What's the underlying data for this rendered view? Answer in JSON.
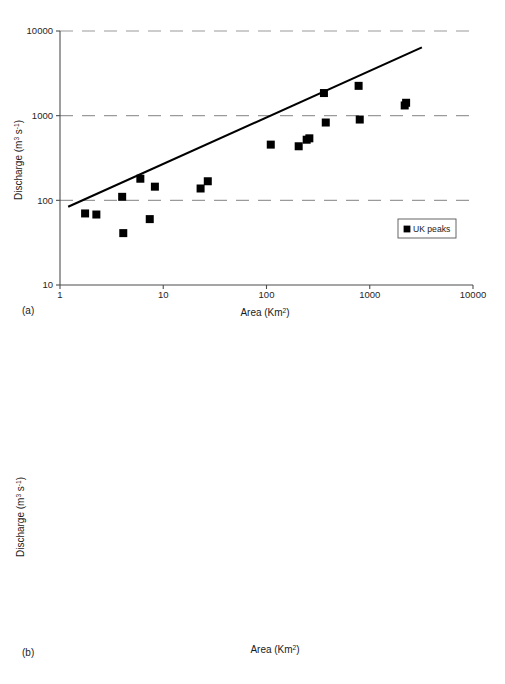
{
  "figure": {
    "panels": [
      {
        "tag": "(a)"
      },
      {
        "tag": "(b)"
      }
    ]
  },
  "chart_data": [
    {
      "type": "scatter",
      "panel": "(a)",
      "title": "",
      "xlabel": "Area (Km2)",
      "xlabel_base": "Area (Km",
      "xlabel_sup": "2",
      "xlabel_tail": ")",
      "ylabel": "Discharge (m3 s-1)",
      "ylabel_base": "Discharge (m",
      "ylabel_sup1": "3",
      "ylabel_mid": " s",
      "ylabel_sup2": "-1",
      "ylabel_tail": ")",
      "xscale": "log",
      "yscale": "log",
      "xlim": [
        1,
        10000
      ],
      "ylim": [
        10,
        10000
      ],
      "xticks": [
        1,
        10,
        100,
        1000,
        10000
      ],
      "xticklabels": [
        "1",
        "10",
        "100",
        "1000",
        "10000"
      ],
      "yticks": [
        10,
        100,
        1000,
        10000
      ],
      "yticklabels": [
        "10",
        "100",
        "1000",
        "10000"
      ],
      "grid": "horizontal-dashed",
      "legend_position": "lower-right",
      "legend": [
        {
          "label": "UK peaks",
          "marker": "square",
          "fill": "filled"
        }
      ],
      "series": [
        {
          "name": "UK peaks",
          "marker": "square",
          "fill": "filled",
          "points": [
            [
              1.75,
              70
            ],
            [
              2.25,
              68
            ],
            [
              4.0,
              110
            ],
            [
              4.1,
              41
            ],
            [
              6.0,
              180
            ],
            [
              7.4,
              60
            ],
            [
              8.3,
              145
            ],
            [
              23,
              138
            ],
            [
              27,
              168
            ],
            [
              110,
              455
            ],
            [
              205,
              435
            ],
            [
              245,
              520
            ],
            [
              260,
              540
            ],
            [
              360,
              1850
            ],
            [
              375,
              830
            ],
            [
              780,
              2250
            ],
            [
              800,
              900
            ],
            [
              2180,
              1320
            ],
            [
              2250,
              1420
            ]
          ]
        }
      ],
      "envelope_curve": {
        "name": "world envelope line",
        "points": [
          [
            1.2,
            84
          ],
          [
            3200,
            6400
          ]
        ]
      }
    },
    {
      "type": "scatter",
      "panel": "(b)",
      "title": "",
      "xlabel": "Area (Km2)",
      "xlabel_base": "Area (Km",
      "xlabel_sup": "2",
      "xlabel_tail": ")",
      "ylabel": "Discharge (m3 s-1)",
      "ylabel_base": "Discharge (m",
      "ylabel_sup1": "3",
      "ylabel_mid": " s",
      "ylabel_sup2": "-1",
      "ylabel_tail": ")",
      "xscale": "log",
      "yscale": "log",
      "xlim": [
        100,
        10000
      ],
      "ylim": [
        1000,
        1000000
      ],
      "xticks": [
        100,
        1000,
        10000
      ],
      "xticklabels": [
        "100",
        "1000",
        "10000"
      ],
      "yticks": [
        1000,
        10000,
        100000,
        1000000
      ],
      "yticklabels": [
        "1000",
        "10000",
        "100000",
        "1000000"
      ],
      "grid": "horizontal-dashed",
      "legend_position": "lower-right",
      "legend": [
        {
          "label": "Rainfall",
          "marker": "diamond",
          "fill": "filled"
        },
        {
          "label": "Snowmelt",
          "marker": "square",
          "fill": "filled"
        },
        {
          "label": "Rain/snow",
          "marker": "triangle",
          "fill": "open"
        },
        {
          "label": "Snowmelt/ice jam",
          "marker": "circle",
          "fill": "open"
        }
      ],
      "series": [
        {
          "name": "Rainfall",
          "marker": "diamond",
          "fill": "filled",
          "points": [
            [
              200,
              9600
            ],
            [
              300,
              16000
            ],
            [
              560,
              5300
            ],
            [
              560,
              2700
            ],
            [
              620,
              64000
            ],
            [
              620,
              7000
            ],
            [
              640,
              15500
            ],
            [
              700,
              33500
            ],
            [
              730,
              36000
            ],
            [
              850,
              96000
            ],
            [
              960,
              16500
            ],
            [
              980,
              3900
            ],
            [
              1030,
              105000
            ],
            [
              1150,
              25000
            ],
            [
              1350,
              51000
            ],
            [
              1450,
              12800
            ],
            [
              1600,
              29000
            ],
            [
              1750,
              37000
            ],
            [
              1950,
              41000
            ],
            [
              2650,
              66000
            ],
            [
              3250,
              73000
            ],
            [
              4800,
              350000
            ]
          ]
        },
        {
          "name": "Snowmelt",
          "marker": "square",
          "fill": "filled",
          "points": [
            [
              290,
              21000
            ],
            [
              560,
              15300
            ],
            [
              615,
              33000
            ],
            [
              810,
              28500
            ],
            [
              960,
              15700
            ],
            [
              965,
              14200
            ],
            [
              1320,
              53000
            ],
            [
              1360,
              50000
            ],
            [
              2350,
              42000
            ]
          ]
        },
        {
          "name": "Rain/snow",
          "marker": "triangle",
          "fill": "open",
          "points": [
            [
              200,
              2700
            ],
            [
              235,
              7300
            ],
            [
              410,
              17000
            ],
            [
              415,
              6800
            ],
            [
              640,
              76000
            ],
            [
              870,
              30500
            ],
            [
              900,
              71000
            ]
          ]
        },
        {
          "name": "Snowmelt/ice jam",
          "marker": "circle",
          "fill": "open",
          "points": [
            [
              2450,
              180000
            ]
          ]
        }
      ],
      "envelope_curve": {
        "name": "world envelope line",
        "points": [
          [
            140,
            7900
          ],
          [
            530,
            105000
          ],
          [
            5300,
            650000
          ]
        ]
      }
    }
  ]
}
